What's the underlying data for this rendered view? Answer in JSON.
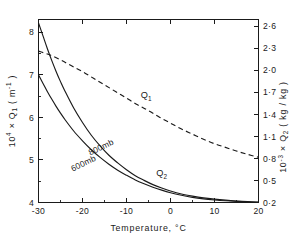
{
  "chart_data": {
    "type": "line",
    "title": "",
    "xlabel": "Temperature,  °C",
    "ylabel_left": "10⁴ × Q₁ (m⁻¹)",
    "ylabel_right": "10⁻³ × Q₂ (kg/kg)",
    "xlim": [
      -30,
      20
    ],
    "ylim_left": [
      4,
      8.3
    ],
    "ylim_right": [
      0.2,
      2.69
    ],
    "grid": false,
    "legend": "inline-curve-labels",
    "xticks": [
      -30,
      -20,
      -10,
      0,
      10,
      20
    ],
    "xtick_labels": [
      "-30",
      "-20",
      "-10",
      "0",
      "10",
      "20"
    ],
    "xminor_count_per_interval": 1,
    "yticks_left": [
      4,
      5,
      6,
      7,
      8
    ],
    "ytick_labels_left": [
      "4",
      "5",
      "6",
      "7",
      "8"
    ],
    "yminor_left": [
      4.5,
      5.5,
      6.5,
      7.5
    ],
    "yticks_right": [
      0.2,
      0.5,
      0.8,
      1.1,
      1.4,
      1.7,
      2.0,
      2.3,
      2.6
    ],
    "ytick_labels_right": [
      "0·2",
      "0·5",
      "0·8",
      "1·1",
      "1·4",
      "1·7",
      "2·0",
      "2·3",
      "2·6"
    ],
    "series": [
      {
        "name": "Q1",
        "label": "Q₁",
        "style": "dashed",
        "axis": "right",
        "label_x": -5.5,
        "label_y": 1.62,
        "x": [
          -30,
          -27.5,
          -25,
          -22.5,
          -20,
          -17.5,
          -15,
          -12.5,
          -10,
          -7.5,
          -5,
          -2.5,
          0,
          2.5,
          5,
          7.5,
          10,
          12.5,
          15,
          17.5,
          20
        ],
        "y": [
          2.26,
          2.21,
          2.14,
          2.06,
          1.98,
          1.89,
          1.8,
          1.71,
          1.62,
          1.53,
          1.45,
          1.36,
          1.28,
          1.2,
          1.13,
          1.06,
          1.0,
          0.95,
          0.9,
          0.855,
          0.815
        ]
      },
      {
        "name": "Q2-800mb",
        "label": "800mb",
        "style": "solid",
        "axis": "left",
        "label_x": -15.5,
        "label_y": 5.24,
        "x": [
          -30,
          -29,
          -28,
          -27,
          -26,
          -25,
          -24,
          -22,
          -20,
          -18,
          -16,
          -14,
          -12,
          -10,
          -8,
          -6,
          -4,
          -2,
          0,
          2.5,
          5,
          7.5,
          10,
          12.5,
          15,
          17.5,
          20
        ],
        "y": [
          8.22,
          7.92,
          7.62,
          7.34,
          7.08,
          6.84,
          6.62,
          6.22,
          5.88,
          5.58,
          5.33,
          5.11,
          4.93,
          4.77,
          4.63,
          4.52,
          4.42,
          4.34,
          4.27,
          4.2,
          4.15,
          4.11,
          4.08,
          4.055,
          4.035,
          4.02,
          4.01
        ]
      },
      {
        "name": "Q2-600mb",
        "label": "600mb",
        "style": "solid",
        "axis": "left",
        "label_x": -19.5,
        "label_y": 4.86,
        "x": [
          -30,
          -29,
          -28,
          -27,
          -26,
          -25,
          -24,
          -22,
          -20,
          -18,
          -16,
          -14,
          -12,
          -10,
          -8,
          -6,
          -4,
          -2,
          0,
          2.5,
          5,
          7.5,
          10,
          12.5,
          15,
          17.5,
          20
        ],
        "y": [
          7.0,
          6.8,
          6.61,
          6.43,
          6.26,
          6.1,
          5.95,
          5.68,
          5.45,
          5.24,
          5.06,
          4.9,
          4.76,
          4.64,
          4.53,
          4.44,
          4.36,
          4.29,
          4.23,
          4.17,
          4.12,
          4.085,
          4.06,
          4.04,
          4.025,
          4.015,
          4.005
        ]
      }
    ],
    "curve_group_label": "Q₂",
    "curve_group_label_x": -2.0,
    "curve_group_label_y": 4.62
  },
  "labels": {
    "x_axis_title": "Temperature,  °C",
    "y_left_prefix": "10",
    "y_left_exp": "4",
    "y_left_mid": " × Q",
    "y_left_sub": "1",
    "y_left_unit": " ( m",
    "y_left_unit_exp": "-1",
    "y_left_unit_close": " )",
    "y_right_prefix": "10",
    "y_right_exp": "-3",
    "y_right_mid": " × Q",
    "y_right_sub": "2",
    "y_right_unit": " ( kg / kg )",
    "q1": "Q",
    "q1_sub": "1",
    "q2": "Q",
    "q2_sub": "2",
    "p800": "800mb",
    "p600": "600mb"
  },
  "colors": {
    "background": "#ffffff",
    "ink": "#1a1a1a"
  }
}
